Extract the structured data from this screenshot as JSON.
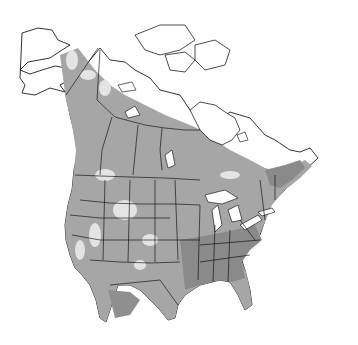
{
  "map": {
    "region": "North America",
    "projection": "conic",
    "style": "grayscale range map",
    "colors": {
      "background": "#ffffff",
      "land_outside_range": "#ffffff",
      "range_light": "#e4e4e4",
      "range_medium": "#a6a6a6",
      "range_dark": "#8a8a8a",
      "boundaries": "#000000"
    },
    "layers": [
      {
        "name": "range-primary",
        "shade": "medium"
      },
      {
        "name": "range-high-density",
        "shade": "dark"
      },
      {
        "name": "range-gaps",
        "shade": "light"
      }
    ]
  }
}
